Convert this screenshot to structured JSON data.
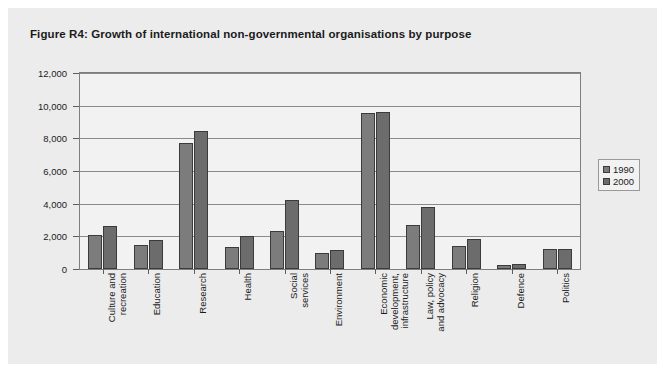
{
  "figure": {
    "title": "Figure R4: Growth of international non-governmental organisations by purpose",
    "panel_color": "#ececed",
    "plot_color": "#f2f2f2"
  },
  "legend": {
    "position": "right",
    "entries": [
      {
        "label": "1990",
        "color": "#7c7c7c"
      },
      {
        "label": "2000",
        "color": "#6c6c6c"
      }
    ]
  },
  "chart_data": {
    "type": "bar",
    "title": "Figure R4: Growth of international non-governmental organisations by purpose",
    "xlabel": "",
    "ylabel": "",
    "ylim": [
      0,
      12000
    ],
    "yticks": [
      0,
      2000,
      4000,
      6000,
      8000,
      10000,
      12000
    ],
    "ytick_labels": [
      "0",
      "2,000",
      "4,000",
      "6,000",
      "8,000",
      "10,000",
      "12,000"
    ],
    "grid": true,
    "legend_position": "right",
    "categories": [
      "Culture and recreation",
      "Education",
      "Research",
      "Health",
      "Social services",
      "Environment",
      "Economic development, infrastructure",
      "Law, policy and advocacy",
      "Religion",
      "Defence",
      "Politics"
    ],
    "category_lines": [
      [
        "Culture and",
        "recreation"
      ],
      [
        "Education"
      ],
      [
        "Research"
      ],
      [
        "Health"
      ],
      [
        "Social",
        "services"
      ],
      [
        "Environment"
      ],
      [
        "Economic",
        "development,",
        "infrastructure"
      ],
      [
        "Law, policy",
        "and advocacy"
      ],
      [
        "Religion"
      ],
      [
        "Defence"
      ],
      [
        "Politics"
      ]
    ],
    "series": [
      {
        "name": "1990",
        "color": "#7c7c7c",
        "values": [
          2100,
          1450,
          7700,
          1350,
          2350,
          1000,
          9550,
          2700,
          1400,
          250,
          1250
        ]
      },
      {
        "name": "2000",
        "color": "#6c6c6c",
        "values": [
          2650,
          1800,
          8450,
          2000,
          4200,
          1150,
          9600,
          3800,
          1850,
          300,
          1250
        ]
      }
    ]
  }
}
